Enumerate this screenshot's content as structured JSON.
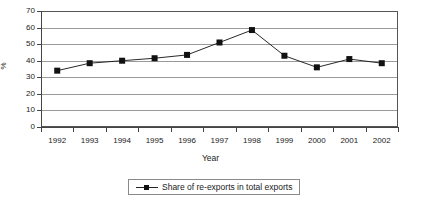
{
  "chart_data": {
    "type": "line",
    "title": "",
    "subtitle": "",
    "xlabel": "Year",
    "ylabel": "%",
    "categories": [
      "1992",
      "1993",
      "1994",
      "1995",
      "1996",
      "1997",
      "1998",
      "1999",
      "2000",
      "2001",
      "2002"
    ],
    "values": [
      34,
      38.5,
      40,
      41.5,
      43.5,
      51,
      58.5,
      43,
      36,
      41,
      38.5
    ],
    "series": [
      {
        "name": "Share of re-exports in total exports",
        "values": [
          34,
          38.5,
          40,
          41.5,
          43.5,
          51,
          58.5,
          43,
          36,
          41,
          38.5
        ],
        "marker": "square",
        "color": "#111111"
      }
    ],
    "ylim": [
      0,
      70
    ],
    "y_ticks": [
      0,
      10,
      20,
      30,
      40,
      50,
      60,
      70
    ],
    "y_tick_labels": [
      "0",
      "10",
      "20",
      "30",
      "40",
      "50",
      "60",
      "70"
    ],
    "grid": "horizontal",
    "legend_position": "bottom",
    "legend_entries": [
      "Share of re-exports in total exports"
    ]
  },
  "axes": {
    "y_title": "%",
    "x_title": "Year"
  },
  "legend": {
    "label": "Share of re-exports in total exports"
  },
  "colors": {
    "series": "#111111",
    "gridline": "#9a9a9a",
    "axis": "#444444",
    "frame": "#555555",
    "background": "#ffffff"
  }
}
